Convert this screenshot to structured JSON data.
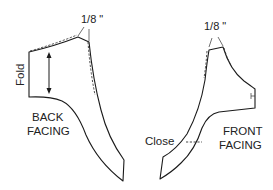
{
  "diagram": {
    "type": "sewing-pattern-facings",
    "stroke_color": "#1a1a1a",
    "background": "#ffffff",
    "pieces": [
      {
        "id": "back-facing",
        "label_line1": "BACK",
        "label_line2": "FACING",
        "fold_label": "Fold",
        "adjustment_label": "1/8 \"",
        "has_grainline_arrow": true
      },
      {
        "id": "front-facing",
        "label_line1": "FRONT",
        "label_line2": "FACING",
        "close_label": "Close",
        "adjustment_label": "1/8 \""
      }
    ]
  }
}
